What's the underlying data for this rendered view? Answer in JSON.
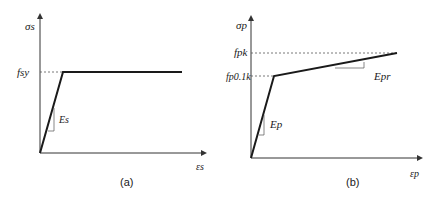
{
  "panels": [
    {
      "id": "a",
      "caption": "(a)",
      "y_axis_label": "σs",
      "x_axis_label": "εs",
      "yield_label": "fsy",
      "slope_label": "Es",
      "model": "elastic-perfectly-plastic"
    },
    {
      "id": "b",
      "caption": "(b)",
      "y_axis_label": "σp",
      "x_axis_label": "εp",
      "upper_label": "fpk",
      "proof_label": "fp0.1k",
      "slope1_label": "Ep",
      "slope2_label": "Epr",
      "model": "bilinear-hardening"
    }
  ],
  "colors": {
    "line": "#1a1a1a",
    "axis": "#333333",
    "dashed": "#555555"
  }
}
